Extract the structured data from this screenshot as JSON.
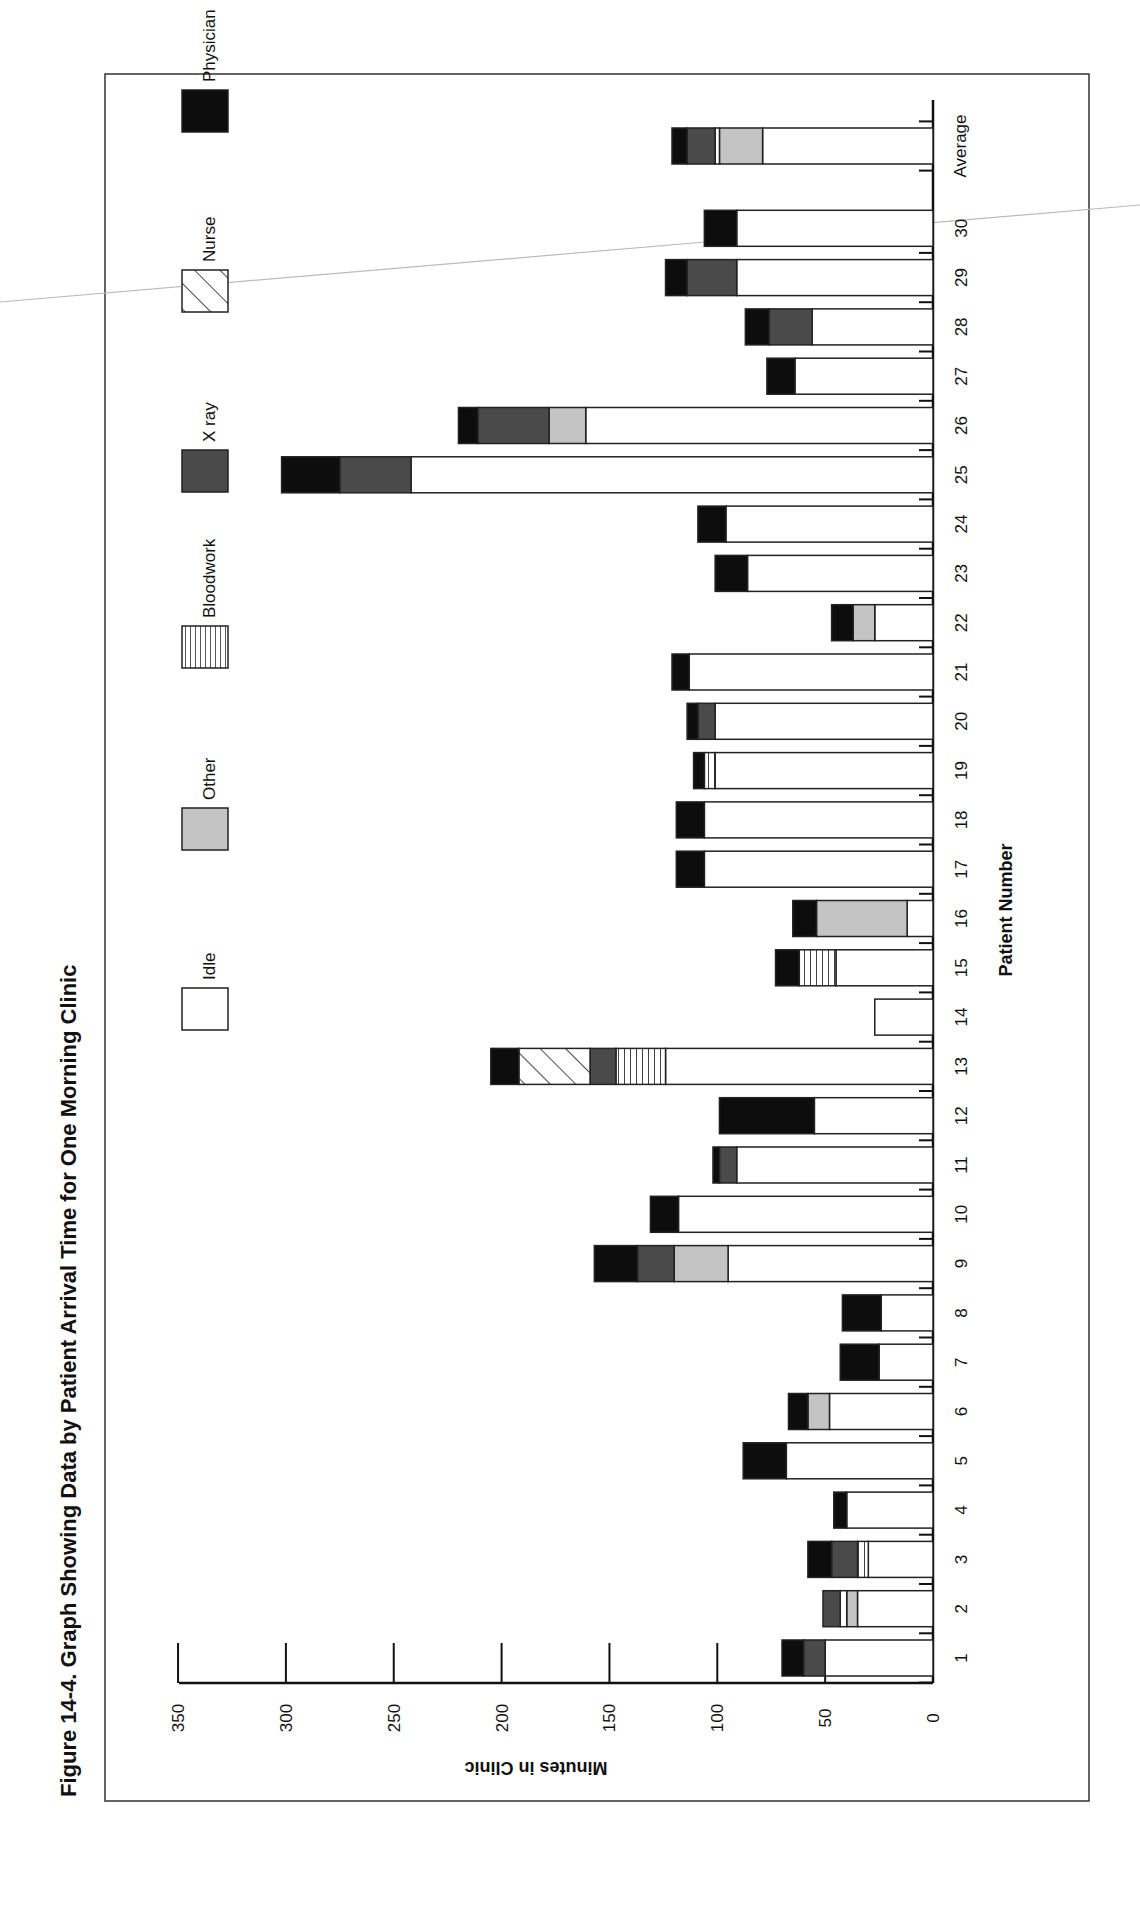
{
  "figure": {
    "title": "Figure 14-4.   Graph Showing Data by Patient Arrival Time for One Morning Clinic"
  },
  "legend": [
    {
      "key": "idle",
      "label": "Idle"
    },
    {
      "key": "other",
      "label": "Other"
    },
    {
      "key": "bloodwork",
      "label": "Bloodwork"
    },
    {
      "key": "xray",
      "label": "X ray"
    },
    {
      "key": "nurse",
      "label": "Nurse"
    },
    {
      "key": "physician",
      "label": "Physician"
    }
  ],
  "colors": {
    "idle": "#ffffff",
    "other": "#c4c4c4",
    "bloodwork": "hatch-horizontal",
    "xray": "#4a4a4a",
    "nurse": "hatch-diagonal",
    "physician": "#0d0d0d"
  },
  "chart_data": {
    "type": "bar",
    "orientation": "stacked-bar (page rotated 90° counter-clockwise)",
    "title": "Graph Showing Data by Patient Arrival Time for One Morning Clinic",
    "xlabel": "Patient Number",
    "ylabel": "Minutes in Clinic",
    "ylim": [
      0,
      350
    ],
    "yticks": [
      0,
      50,
      100,
      150,
      200,
      250,
      300,
      350
    ],
    "grid": false,
    "legend_position": "top (left side of rotated page)",
    "categories": [
      "1",
      "2",
      "3",
      "4",
      "5",
      "6",
      "7",
      "8",
      "9",
      "10",
      "11",
      "12",
      "13",
      "14",
      "15",
      "16",
      "17",
      "18",
      "19",
      "20",
      "21",
      "22",
      "23",
      "24",
      "25",
      "26",
      "27",
      "28",
      "29",
      "30",
      "Average"
    ],
    "series": [
      {
        "name": "Idle",
        "values": [
          50,
          35,
          30,
          40,
          68,
          48,
          25,
          24,
          95,
          118,
          91,
          55,
          124,
          27,
          45,
          12,
          106,
          106,
          101,
          101,
          113,
          27,
          86,
          96,
          242,
          161,
          64,
          56,
          91,
          91,
          79
        ]
      },
      {
        "name": "Other",
        "values": [
          0,
          5,
          0,
          0,
          0,
          10,
          0,
          0,
          25,
          0,
          0,
          0,
          0,
          0,
          0,
          42,
          0,
          0,
          0,
          0,
          0,
          10,
          0,
          0,
          0,
          17,
          0,
          0,
          0,
          0,
          20
        ]
      },
      {
        "name": "Bloodwork",
        "values": [
          0,
          3,
          5,
          0,
          0,
          0,
          0,
          0,
          0,
          0,
          0,
          0,
          23,
          0,
          17,
          0,
          0,
          0,
          5,
          0,
          0,
          0,
          0,
          0,
          0,
          0,
          0,
          0,
          0,
          0,
          2
        ]
      },
      {
        "name": "X ray",
        "values": [
          10,
          8,
          12,
          0,
          0,
          0,
          0,
          0,
          17,
          0,
          8,
          0,
          12,
          0,
          0,
          0,
          0,
          0,
          0,
          8,
          0,
          0,
          0,
          0,
          33,
          33,
          0,
          20,
          23,
          0,
          13
        ]
      },
      {
        "name": "Nurse",
        "values": [
          0,
          0,
          0,
          0,
          0,
          0,
          0,
          0,
          0,
          0,
          0,
          0,
          33,
          0,
          0,
          0,
          0,
          0,
          0,
          0,
          0,
          0,
          0,
          0,
          0,
          0,
          0,
          0,
          0,
          0,
          0
        ]
      },
      {
        "name": "Physician",
        "values": [
          10,
          0,
          11,
          6,
          20,
          9,
          18,
          18,
          20,
          13,
          3,
          44,
          13,
          0,
          11,
          11,
          13,
          13,
          5,
          5,
          8,
          10,
          15,
          13,
          27,
          9,
          13,
          11,
          10,
          15,
          7
        ]
      }
    ],
    "totals": [
      70,
      51,
      58,
      46,
      88,
      67,
      43,
      42,
      157,
      131,
      102,
      99,
      205,
      27,
      73,
      65,
      119,
      119,
      111,
      114,
      121,
      47,
      101,
      109,
      302,
      220,
      77,
      87,
      124,
      106,
      121
    ]
  }
}
